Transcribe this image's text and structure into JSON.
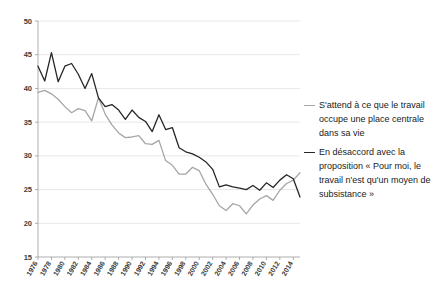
{
  "chart_data": {
    "type": "line",
    "title": "",
    "xlabel": "",
    "ylabel": "",
    "ylim": [
      15,
      50
    ],
    "ytick_labels": [
      "50",
      "45",
      "40",
      "35",
      "30",
      "25",
      "20",
      "15"
    ],
    "ytick_values": [
      50,
      45,
      40,
      35,
      30,
      25,
      20,
      15
    ],
    "grid": true,
    "legend_position": "right",
    "xtick_labels": [
      "1976",
      "1978",
      "1980",
      "1982",
      "1984",
      "1986",
      "1988",
      "1990",
      "1992",
      "1994",
      "1996",
      "1998",
      "2000",
      "2002",
      "2004",
      "2006",
      "2008",
      "2010",
      "2012",
      "2014"
    ],
    "x": [
      1976,
      1977,
      1978,
      1979,
      1980,
      1981,
      1982,
      1983,
      1984,
      1985,
      1986,
      1987,
      1988,
      1989,
      1990,
      1991,
      1992,
      1993,
      1994,
      1995,
      1996,
      1997,
      1998,
      1999,
      2000,
      2001,
      2002,
      2003,
      2004,
      2005,
      2006,
      2007,
      2008,
      2009,
      2010,
      2011,
      2012,
      2013,
      2014,
      2015
    ],
    "series": [
      {
        "name": "S'attend à ce que le travail occupe une place centrale dans sa vie",
        "color": "#a6a6a6",
        "values": [
          39.4,
          39.7,
          39.2,
          38.4,
          37.3,
          36.4,
          37.0,
          36.7,
          35.2,
          38.6,
          36.2,
          34.6,
          33.4,
          32.7,
          32.8,
          33.0,
          31.8,
          31.7,
          32.3,
          29.3,
          28.6,
          27.3,
          27.3,
          28.3,
          27.8,
          25.8,
          24.3,
          22.6,
          21.9,
          22.9,
          22.6,
          21.4,
          22.7,
          23.6,
          24.1,
          23.4,
          24.9,
          25.9,
          26.4,
          27.5
        ]
      },
      {
        "name": "En désaccord avec la proposition « Pour moi, le travail n'est qu'un moyen de subsistance »",
        "color": "#262626",
        "values": [
          43.3,
          41.1,
          45.3,
          41.0,
          43.3,
          43.7,
          42.1,
          40.0,
          42.2,
          38.6,
          37.3,
          37.6,
          36.8,
          35.4,
          36.8,
          35.7,
          35.1,
          33.6,
          36.1,
          33.9,
          34.2,
          31.2,
          30.6,
          30.3,
          29.8,
          29.1,
          28.0,
          25.4,
          25.7,
          25.4,
          25.2,
          25.0,
          25.6,
          24.9,
          26.0,
          25.3,
          26.4,
          27.2,
          26.6,
          23.9
        ]
      }
    ]
  },
  "legend": {
    "entries": [
      {
        "label": "S'attend à ce que le travail occupe une place centrale dans sa vie",
        "swatch": "line-swatch-gray"
      },
      {
        "label": "En désaccord avec la proposition « Pour moi, le travail n'est qu'un moyen de subsistance »",
        "swatch": "line-swatch-black"
      }
    ]
  }
}
